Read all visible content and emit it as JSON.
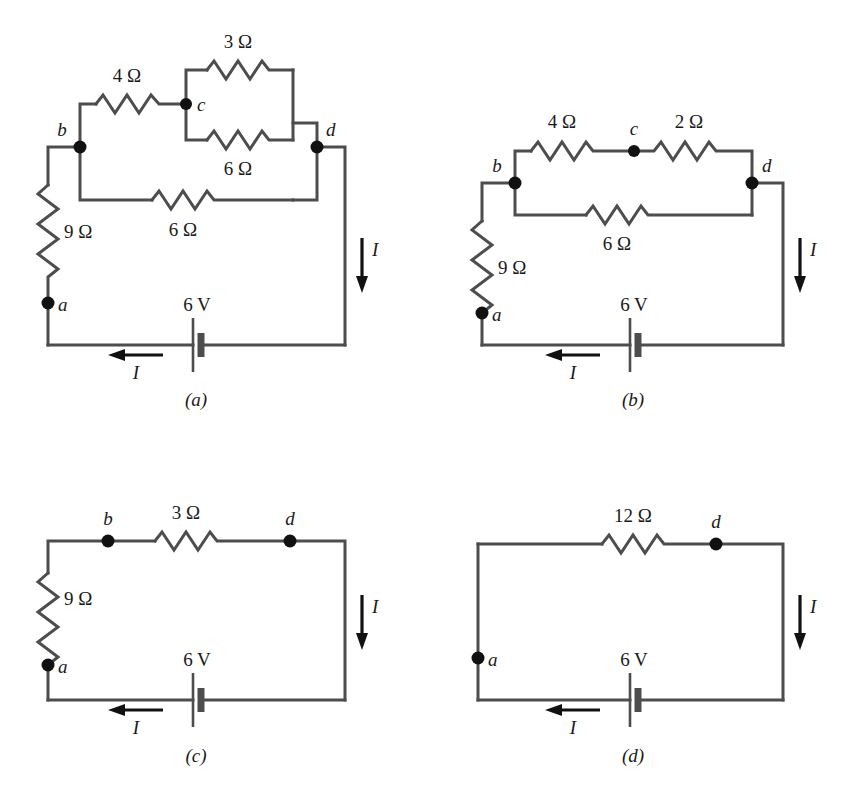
{
  "figure": {
    "background": "#ffffff",
    "wire_color": "#4d4d4d",
    "node_color": "#111111"
  },
  "circuits": [
    {
      "id": "a",
      "caption": "(a)",
      "nodes": [
        {
          "id": "b",
          "label": "b"
        },
        {
          "id": "c",
          "label": "c"
        },
        {
          "id": "d",
          "label": "d"
        },
        {
          "id": "a",
          "label": "a"
        }
      ],
      "resistors": [
        {
          "id": "r4",
          "label": "4 Ω",
          "value": 4,
          "unit": "Ω"
        },
        {
          "id": "r3",
          "label": "3 Ω",
          "value": 3,
          "unit": "Ω"
        },
        {
          "id": "r6p",
          "label": "6 Ω",
          "value": 6,
          "unit": "Ω"
        },
        {
          "id": "r6b",
          "label": "6 Ω",
          "value": 6,
          "unit": "Ω"
        },
        {
          "id": "r9",
          "label": "9 Ω",
          "value": 9,
          "unit": "Ω"
        }
      ],
      "source": {
        "label": "6 V",
        "value": 6,
        "unit": "V"
      },
      "currents": [
        {
          "id": "i-right",
          "label": "I",
          "direction": "down"
        },
        {
          "id": "i-bottom",
          "label": "I",
          "direction": "left"
        }
      ]
    },
    {
      "id": "b",
      "caption": "(b)",
      "nodes": [
        {
          "id": "b",
          "label": "b"
        },
        {
          "id": "c",
          "label": "c"
        },
        {
          "id": "d",
          "label": "d"
        },
        {
          "id": "a",
          "label": "a"
        }
      ],
      "resistors": [
        {
          "id": "r4",
          "label": "4 Ω",
          "value": 4,
          "unit": "Ω"
        },
        {
          "id": "r2",
          "label": "2 Ω",
          "value": 2,
          "unit": "Ω"
        },
        {
          "id": "r6b",
          "label": "6 Ω",
          "value": 6,
          "unit": "Ω"
        },
        {
          "id": "r9",
          "label": "9 Ω",
          "value": 9,
          "unit": "Ω"
        }
      ],
      "source": {
        "label": "6 V",
        "value": 6,
        "unit": "V"
      },
      "currents": [
        {
          "id": "i-right",
          "label": "I",
          "direction": "down"
        },
        {
          "id": "i-bottom",
          "label": "I",
          "direction": "left"
        }
      ]
    },
    {
      "id": "c",
      "caption": "(c)",
      "nodes": [
        {
          "id": "b",
          "label": "b"
        },
        {
          "id": "d",
          "label": "d"
        },
        {
          "id": "a",
          "label": "a"
        }
      ],
      "resistors": [
        {
          "id": "r3",
          "label": "3 Ω",
          "value": 3,
          "unit": "Ω"
        },
        {
          "id": "r9",
          "label": "9 Ω",
          "value": 9,
          "unit": "Ω"
        }
      ],
      "source": {
        "label": "6 V",
        "value": 6,
        "unit": "V"
      },
      "currents": [
        {
          "id": "i-right",
          "label": "I",
          "direction": "down"
        },
        {
          "id": "i-bottom",
          "label": "I",
          "direction": "left"
        }
      ]
    },
    {
      "id": "d",
      "caption": "(d)",
      "nodes": [
        {
          "id": "d",
          "label": "d"
        },
        {
          "id": "a",
          "label": "a"
        }
      ],
      "resistors": [
        {
          "id": "r12",
          "label": "12 Ω",
          "value": 12,
          "unit": "Ω"
        }
      ],
      "source": {
        "label": "6 V",
        "value": 6,
        "unit": "V"
      },
      "currents": [
        {
          "id": "i-right",
          "label": "I",
          "direction": "down"
        },
        {
          "id": "i-bottom",
          "label": "I",
          "direction": "left"
        }
      ]
    }
  ]
}
